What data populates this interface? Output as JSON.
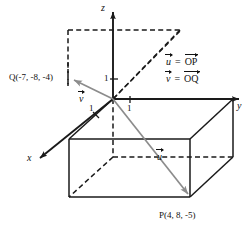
{
  "figure": {
    "axes": {
      "z_label": "z",
      "y_label": "y",
      "x_label": "x"
    },
    "ticks": {
      "z_one": "1",
      "y_one": "1",
      "x_one": "1"
    },
    "points": {
      "P": "P(4, 8, -5)",
      "Q": "Q(-7, -8, -4)"
    },
    "vectors": {
      "u_label": "u",
      "v_label": "v"
    },
    "legend": {
      "u_equals": "=",
      "u_target": "OP",
      "u_symbol": "u",
      "v_equals": "=",
      "v_target": "OQ",
      "v_symbol": "v"
    },
    "colors": {
      "axis": "#1a1a1a",
      "box_edge": "#1a1a1a",
      "vector": "#8c8c8c",
      "dashed": "#1a1a1a",
      "background": "#ffffff"
    }
  }
}
